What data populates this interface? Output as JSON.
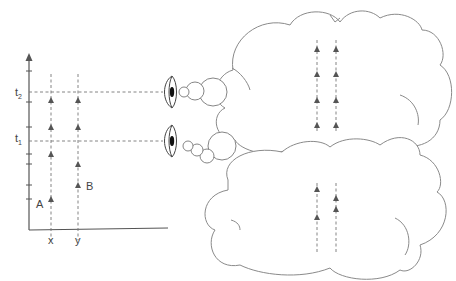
{
  "diagram": {
    "type": "spacetime-observers",
    "axis": {
      "time_labels": [
        {
          "id": "t2",
          "base": "t",
          "sub": "2"
        },
        {
          "id": "t1",
          "base": "t",
          "sub": "1"
        }
      ],
      "position_labels": [
        "x",
        "y"
      ]
    },
    "events": {
      "A": "A",
      "B": "B"
    },
    "worldlines": [
      {
        "position": "x",
        "label": "A",
        "arrow_count": 4
      },
      {
        "position": "y",
        "label": "B",
        "arrow_count": 4
      }
    ],
    "observers": [
      {
        "id": "observer-t2",
        "time": "t2",
        "thought_cloud": "upper",
        "cloud_arrows_per_line": 4
      },
      {
        "id": "observer-t1",
        "time": "t1",
        "thought_cloud": "lower",
        "cloud_arrows_left": 2,
        "cloud_arrows_right": 2
      }
    ],
    "colors": {
      "stroke": "#555555",
      "cloud": "#8a8a8a",
      "background": "#ffffff"
    }
  }
}
